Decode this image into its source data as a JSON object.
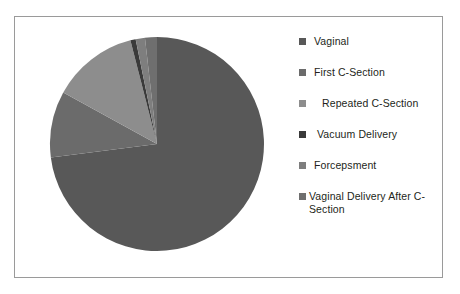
{
  "frame": {
    "border_color": "#9a9a9a",
    "background": "#ffffff"
  },
  "legend": {
    "position": "right",
    "items": [
      {
        "label": "Vaginal",
        "color": "#585858",
        "marker": "square-marker"
      },
      {
        "label": "First C-Section",
        "color": "#6b6b6b",
        "marker": "square-marker"
      },
      {
        "label": " Repeated C-Section",
        "color": "#8d8d8d",
        "marker": "square-marker"
      },
      {
        "label": " Vacuum Delivery",
        "color": "#3a3a3a",
        "marker": "square-marker"
      },
      {
        "label": "Forcepsment",
        "color": "#7e7e7e",
        "marker": "square-marker"
      },
      {
        "label": "Vaginal Delivery After C-Section",
        "color": "#6f6f6f",
        "marker": "square-marker"
      }
    ]
  },
  "chart_data": {
    "type": "pie",
    "title": "",
    "xlabel": "",
    "ylabel": "",
    "legend_position": "right",
    "grid": false,
    "start_angle_deg": 0,
    "direction": "clockwise",
    "categories": [
      "Vaginal",
      "First C-Section",
      "Repeated C-Section",
      "Vacuum Delivery",
      "Forceps Delivery",
      "Vaginal Delivery After C-Section"
    ],
    "values": [
      73,
      10,
      13,
      0.8,
      1.4,
      1.8
    ],
    "units": "percent",
    "colors": [
      "#585858",
      "#6b6b6b",
      "#8d8d8d",
      "#3a3a3a",
      "#7e7e7e",
      "#6f6f6f"
    ]
  }
}
